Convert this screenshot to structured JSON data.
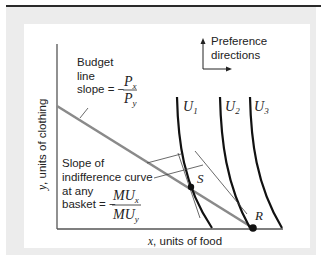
{
  "figure": {
    "preference_label_line1": "Preference",
    "preference_label_line2": "directions",
    "budget_label_line1": "Budget",
    "budget_label_line2": "line",
    "budget_slope_prefix": "slope = −",
    "budget_slope_num": "P",
    "budget_slope_num_sub": "x",
    "budget_slope_den": "P",
    "budget_slope_den_sub": "y",
    "ic_label_line1": "Slope of",
    "ic_label_line2": "indifference curve",
    "ic_label_line3": "at any",
    "ic_label_line4_prefix": "basket = −",
    "ic_slope_num": "MU",
    "ic_slope_num_sub": "x",
    "ic_slope_den": "MU",
    "ic_slope_den_sub": "y",
    "y_axis_var": "y",
    "y_axis_label": ", units of clothing",
    "x_axis_var": "x",
    "x_axis_label": ", units of food",
    "curves": [
      {
        "name": "U",
        "sub": "1"
      },
      {
        "name": "U",
        "sub": "2"
      },
      {
        "name": "U",
        "sub": "3"
      }
    ],
    "point_s": "S",
    "point_r": "R",
    "colors": {
      "budget_line": "#8a8a8a",
      "curves": "#111111",
      "axes": "#555555",
      "frame_bg": "#ececec",
      "top_rule": "#2a2a2a"
    }
  }
}
